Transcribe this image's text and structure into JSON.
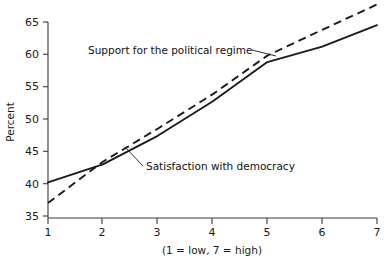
{
  "chart_data": {
    "type": "line",
    "title": "",
    "xlabel": "(1 = low, 7 = high)",
    "ylabel": "Percent",
    "x": [
      1,
      2,
      3,
      4,
      5,
      6,
      7
    ],
    "xticklabels": [
      "1",
      "2",
      "3",
      "4",
      "5",
      "6",
      "7"
    ],
    "yticklabels": [
      "35",
      "40",
      "45",
      "50",
      "55",
      "60",
      "65"
    ],
    "yticks": [
      35,
      40,
      45,
      50,
      55,
      60,
      65
    ],
    "xlim": [
      1,
      7
    ],
    "ylim": [
      34,
      68
    ],
    "grid": false,
    "legend": "annotations-on-plot",
    "series": [
      {
        "name": "Satisfaction with democracy",
        "style": "solid",
        "values": [
          40.2,
          43.0,
          47.4,
          52.7,
          58.8,
          61.2,
          64.5
        ]
      },
      {
        "name": "Support for the political regime",
        "style": "dashed",
        "values": [
          37.0,
          43.4,
          48.5,
          53.8,
          59.8,
          63.8,
          67.7
        ]
      }
    ],
    "annotations": [
      {
        "text": "Support for the political regime",
        "target_series": "Support for the political regime"
      },
      {
        "text": "Satisfaction with democracy",
        "target_series": "Satisfaction with democracy"
      }
    ],
    "colors": {
      "line": "#1a1a1a",
      "axis": "#3a3a3a",
      "background": "#ffffff"
    }
  }
}
